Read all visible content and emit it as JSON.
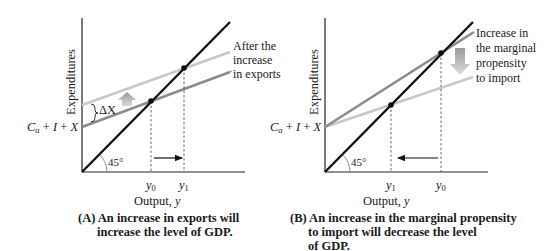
{
  "panels": [
    {
      "id": "A",
      "y_axis_label": "Expenditures",
      "x_axis_label": "Output, y",
      "intercept_label": "C_a + I + X",
      "angle_label": "45°",
      "delta_label": "ΔX",
      "tick_labels": [
        "y0",
        "y1"
      ],
      "annotation": [
        "After the",
        "increase",
        "in exports"
      ],
      "caption_tag": "(A)",
      "caption_lines": [
        "An increase in exports will",
        "increase the level of GDP."
      ],
      "lines": {
        "original_ae": {
          "color": "#8c8c8c"
        },
        "new_ae": {
          "color": "#c8c8c8"
        },
        "forty_five": {
          "color": "#111111"
        }
      },
      "shift_arrow_direction": "up",
      "output_arrow_direction": "right"
    },
    {
      "id": "B",
      "y_axis_label": "Expenditures",
      "x_axis_label": "Output, y",
      "intercept_label": "C_a + I + X",
      "angle_label": "45°",
      "tick_labels": [
        "y1",
        "y0"
      ],
      "annotation": [
        "Increase in",
        "the marginal",
        "propensity",
        "to import"
      ],
      "caption_tag": "(B)",
      "caption_lines": [
        "An increase in the marginal propensity",
        "to import will decrease the level",
        "of GDP."
      ],
      "lines": {
        "original_ae": {
          "color": "#8c8c8c"
        },
        "new_ae": {
          "color": "#c8c8c8"
        },
        "forty_five": {
          "color": "#111111"
        }
      },
      "shift_arrow_direction": "down",
      "output_arrow_direction": "left"
    }
  ],
  "subscripts": {
    "a": "a",
    "zero": "0",
    "one": "1"
  },
  "var": {
    "C": "C",
    "I": "I",
    "X": "X",
    "plus": "+",
    "y": "y"
  }
}
